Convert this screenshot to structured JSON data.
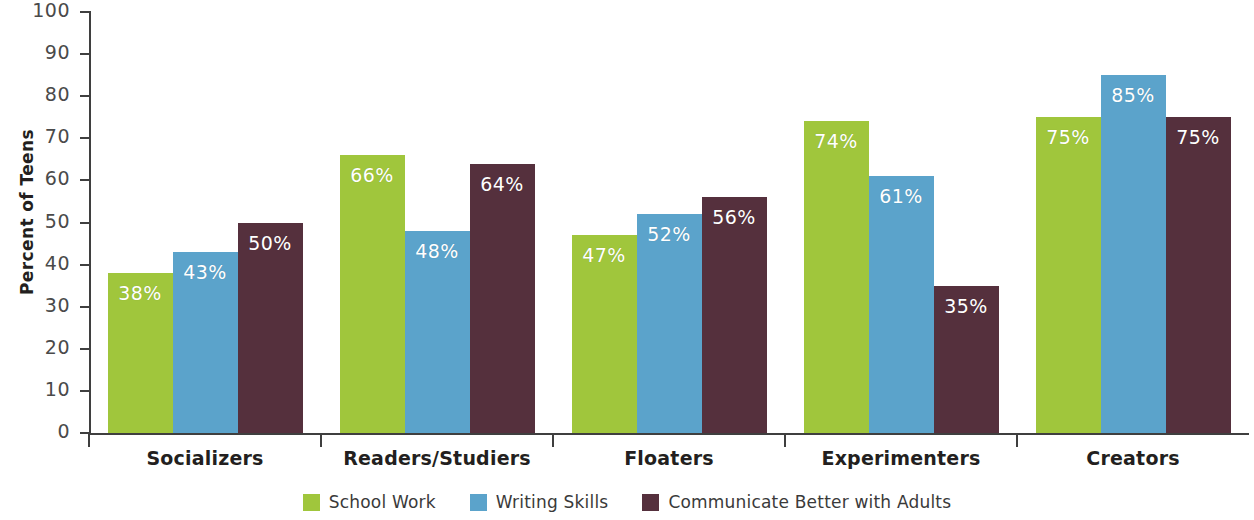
{
  "chart_data": {
    "type": "bar",
    "title": "",
    "xlabel": "",
    "ylabel": "Percent of Teens",
    "ylim": [
      0,
      100
    ],
    "ytick_step": 10,
    "yticks": [
      100,
      90,
      80,
      70,
      60,
      50,
      40,
      30,
      20,
      10,
      0
    ],
    "ytick_labels": [
      "100",
      "90",
      "80",
      "70",
      "60",
      "50",
      "40",
      "30",
      "20",
      "10",
      "0"
    ],
    "grid": false,
    "legend_position": "bottom-center",
    "value_label_suffix": "%",
    "categories": [
      "Socializers",
      "Readers/Studiers",
      "Floaters",
      "Experimenters",
      "Creators"
    ],
    "series": [
      {
        "name": "School Work",
        "color": "#a0c63c",
        "values": [
          38,
          66,
          47,
          74,
          75
        ],
        "labels": [
          "38%",
          "66%",
          "47%",
          "74%",
          "75%"
        ]
      },
      {
        "name": "Writing Skills",
        "color": "#5ba3cb",
        "values": [
          43,
          48,
          52,
          61,
          85
        ],
        "labels": [
          "43%",
          "48%",
          "52%",
          "61%",
          "85%"
        ]
      },
      {
        "name": "Communicate Better with Adults",
        "color": "#55303d",
        "values": [
          50,
          64,
          56,
          35,
          75
        ],
        "labels": [
          "50%",
          "64%",
          "56%",
          "35%",
          "75%"
        ]
      }
    ]
  },
  "axis": {
    "y_title": "Percent of Teens"
  },
  "legend": {
    "items": [
      {
        "label": "School Work",
        "color": "#a0c63c"
      },
      {
        "label": "Writing Skills",
        "color": "#5ba3cb"
      },
      {
        "label": "Communicate Better with Adults",
        "color": "#55303d"
      }
    ]
  }
}
